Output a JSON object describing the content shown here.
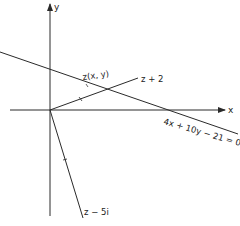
{
  "diagram": {
    "axes": {
      "x_label": "x",
      "y_label": "y"
    },
    "labels": {
      "point": "z(x, y)",
      "vector_plus_2": "z + 2",
      "vector_minus_5i": "z − 5i",
      "line_equation": "4x + 10y − 21 = 0"
    },
    "colors": {
      "stroke": "#2a2a2a",
      "background": "#ffffff"
    }
  }
}
